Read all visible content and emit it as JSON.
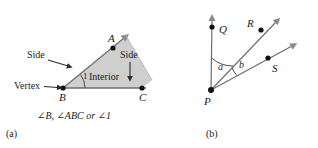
{
  "figure": {
    "background_color": "#ffffff",
    "ink_color": "#1a1a1a",
    "shade_color": "#cccccc",
    "line_color": "#808080"
  },
  "panel_a": {
    "label": "(a)",
    "caption": "∠B, ∠ABC or ∠1",
    "vertex_callout": "Vertex",
    "side_callout_left": "Side",
    "side_callout_right": "Side",
    "interior_label": "Interior",
    "angle_number": "1",
    "points": [
      {
        "name": "A",
        "label": "A",
        "x": 113,
        "y": 48
      },
      {
        "name": "B",
        "label": "B",
        "x": 63,
        "y": 88
      },
      {
        "name": "C",
        "label": "C",
        "x": 142,
        "y": 88
      }
    ]
  },
  "panel_b": {
    "label": "(b)",
    "vertex_label": "P",
    "angle_a_label": "a",
    "angle_b_label": "b",
    "points": [
      {
        "name": "P",
        "label": "P",
        "x": 211,
        "y": 90
      },
      {
        "name": "Q",
        "label": "Q",
        "x": 212,
        "y": 27
      },
      {
        "name": "R",
        "label": "R",
        "x": 261,
        "y": 30
      },
      {
        "name": "S",
        "label": "S",
        "x": 268,
        "y": 58
      }
    ],
    "rays": [
      {
        "name": "ray-PQ",
        "through": "Q"
      },
      {
        "name": "ray-PR",
        "through": "R"
      },
      {
        "name": "ray-PS",
        "through": "S"
      }
    ]
  }
}
